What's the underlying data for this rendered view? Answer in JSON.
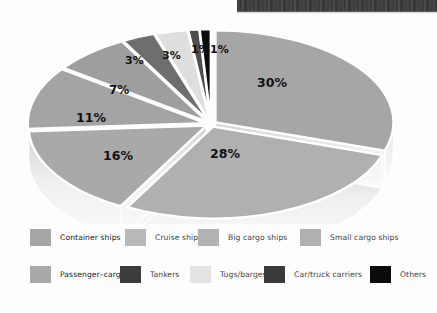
{
  "figure": {
    "background_color": "#fdfdfd",
    "scan_artifact": {
      "name": "photo-strip-artifact",
      "description": "dark scanned photo edge",
      "color": "#2b2b2b"
    }
  },
  "chart_data": {
    "type": "pie",
    "title": "",
    "subtitle": "",
    "xlabel": "",
    "ylabel": "",
    "three_d": true,
    "exploded": true,
    "legend_position": "bottom",
    "grid": false,
    "units": "percent",
    "categories": [
      "Container ships",
      "Cruise ships",
      "Big cargo ships",
      "Small cargo ships",
      "Passenger–cargo",
      "Tankers",
      "Tugs/barges",
      "Car/truck carriers",
      "Others"
    ],
    "values": [
      30,
      28,
      16,
      11,
      7,
      3,
      3,
      1,
      1
    ],
    "labels": [
      "30%",
      "28%",
      "16%",
      "11%",
      "7%",
      "3%",
      "3%",
      "1%",
      "1%"
    ],
    "colors": [
      "#a6a6a6",
      "#b0b0b0",
      "#a9a9a9",
      "#a4a4a4",
      "#9e9e9e",
      "#6e6e6e",
      "#dedede",
      "#4d4d4d",
      "#0d0d0d"
    ],
    "slice_edge_color": "#ffffff",
    "side_wall_color": "#e9e9e9"
  },
  "slice_labels": [
    {
      "text": "30%",
      "left": 243,
      "top": 51,
      "size": 12.5
    },
    {
      "text": "28%",
      "left": 196,
      "top": 122,
      "size": 12.5
    },
    {
      "text": "16%",
      "left": 89,
      "top": 124,
      "size": 12.5
    },
    {
      "text": "11%",
      "left": 62,
      "top": 86,
      "size": 12.5
    },
    {
      "text": "7%",
      "left": 95,
      "top": 58,
      "size": 12.0
    },
    {
      "text": "3%",
      "left": 111,
      "top": 29,
      "size": 11.0
    },
    {
      "text": "3%",
      "left": 148,
      "top": 24,
      "size": 11.0
    },
    {
      "text": "1%",
      "left": 177,
      "top": 18,
      "size": 11.0
    },
    {
      "text": "1%",
      "left": 196,
      "top": 18,
      "size": 11.0
    }
  ],
  "legend": {
    "rows": [
      {
        "items": [
          {
            "label": "Container ships",
            "color": "#a6a6a6",
            "left": 30,
            "emphasis": true
          },
          {
            "label": "Cruise ships",
            "color": "#b9b9b9",
            "left": 125,
            "emphasis": false
          },
          {
            "label": "Big cargo ships",
            "color": "#b2b2b2",
            "left": 198,
            "emphasis": false
          },
          {
            "label": "Small cargo ships",
            "color": "#b0b0b0",
            "left": 300,
            "emphasis": false
          }
        ]
      },
      {
        "items": [
          {
            "label": "Passenger–cargo",
            "color": "#a8a8a8",
            "left": 30,
            "emphasis": true
          },
          {
            "label": "Tankers",
            "color": "#3c3c3c",
            "left": 120,
            "emphasis": false
          },
          {
            "label": "Tugs/barges",
            "color": "#e4e4e4",
            "left": 190,
            "emphasis": false
          },
          {
            "label": "Car/truck carriers",
            "color": "#3a3a3a",
            "left": 264,
            "emphasis": false
          },
          {
            "label": "Others",
            "color": "#0b0b0b",
            "left": 370,
            "emphasis": false
          }
        ]
      }
    ]
  }
}
